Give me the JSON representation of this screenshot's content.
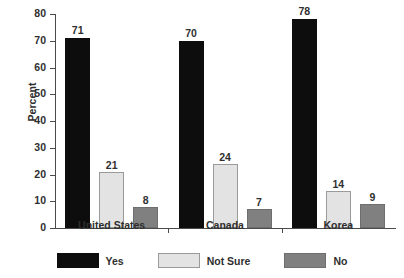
{
  "chart_data": {
    "type": "bar",
    "title": "",
    "xlabel": "",
    "ylabel": "Percent",
    "ylim": [
      0,
      80
    ],
    "ytick_step": 10,
    "yticks": [
      0,
      10,
      20,
      30,
      40,
      50,
      60,
      70,
      80
    ],
    "grid": false,
    "legend_position": "bottom",
    "categories": [
      "United States",
      "Canada",
      "Korea"
    ],
    "series": [
      {
        "name": "Yes",
        "color": "#0d0d0d",
        "values": [
          71,
          70,
          78
        ]
      },
      {
        "name": "Not Sure",
        "color": "#e3e3e3",
        "values": [
          21,
          24,
          14
        ]
      },
      {
        "name": "No",
        "color": "#808080",
        "values": [
          8,
          7,
          9
        ]
      }
    ]
  },
  "colors": {
    "yes": "#0d0d0d",
    "not_sure": "#e3e3e3",
    "no": "#808080",
    "axis": "#4a4a4a",
    "text": "#2f2f2f",
    "background": "#ffffff"
  }
}
